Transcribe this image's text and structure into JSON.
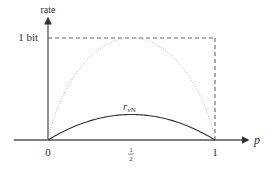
{
  "chart_data": {
    "type": "line",
    "title": "",
    "xlabel": "p",
    "ylabel": "rate",
    "xlim": [
      0,
      1
    ],
    "ylim": [
      0,
      1
    ],
    "x_ticks": [
      {
        "value": 0,
        "label": "0"
      },
      {
        "value": 0.5,
        "label": "1/2"
      },
      {
        "value": 1,
        "label": "1"
      }
    ],
    "y_ticks": [
      {
        "value": 1,
        "label": "1 bit"
      }
    ],
    "grid": false,
    "series": [
      {
        "name": "binary entropy H(p)",
        "style": "dotted",
        "color": "#bbbbbb",
        "x": [
          0,
          0.05,
          0.1,
          0.2,
          0.3,
          0.4,
          0.5,
          0.6,
          0.7,
          0.8,
          0.9,
          0.95,
          1
        ],
        "values": [
          0,
          0.286,
          0.469,
          0.722,
          0.881,
          0.971,
          1.0,
          0.971,
          0.881,
          0.722,
          0.469,
          0.286,
          0
        ]
      },
      {
        "name": "r_vN",
        "label": "r",
        "label_sub": "vN",
        "style": "solid",
        "color": "#333333",
        "x": [
          0,
          0.1,
          0.2,
          0.3,
          0.4,
          0.5,
          0.6,
          0.7,
          0.8,
          0.9,
          1
        ],
        "values": [
          0,
          0.09,
          0.16,
          0.21,
          0.24,
          0.25,
          0.24,
          0.21,
          0.16,
          0.09,
          0
        ]
      }
    ],
    "annotations": [
      {
        "type": "dashed-hline",
        "y": 1,
        "x_from": 0,
        "x_to": 1,
        "label": "1 bit"
      },
      {
        "type": "dashed-vline",
        "x": 1,
        "y_from": 0,
        "y_to": 1
      }
    ],
    "legend": "none"
  },
  "labels": {
    "ylabel": "rate",
    "xlabel": "p",
    "one_bit": "1 bit",
    "tick0": "0",
    "tick_half_num": "1",
    "tick_half_den": "2",
    "tick1": "1",
    "rvn_main": "r",
    "rvn_sub": "vN"
  }
}
